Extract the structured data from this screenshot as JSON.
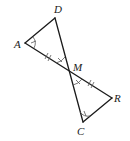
{
  "diagram": {
    "type": "geometry",
    "colors": {
      "line": "#1a1a1a",
      "marks": "#555555",
      "background": "#ffffff"
    },
    "points": {
      "A": {
        "label": "A",
        "x": 25,
        "y": 43
      },
      "D": {
        "label": "D",
        "x": 55,
        "y": 18
      },
      "M": {
        "label": "M",
        "x": 69,
        "y": 71
      },
      "R": {
        "label": "R",
        "x": 112,
        "y": 98
      },
      "C": {
        "label": "C",
        "x": 83,
        "y": 122
      }
    },
    "segments": [
      [
        "A",
        "D"
      ],
      [
        "A",
        "R"
      ],
      [
        "D",
        "C"
      ],
      [
        "R",
        "C"
      ]
    ],
    "congruence_marks": {
      "segments_double_tick": [
        "AM",
        "MR"
      ],
      "angles_single_arc_tick": [
        "A",
        "C"
      ],
      "angles_vertical_at_M": [
        "AMD",
        "RMC"
      ]
    }
  }
}
